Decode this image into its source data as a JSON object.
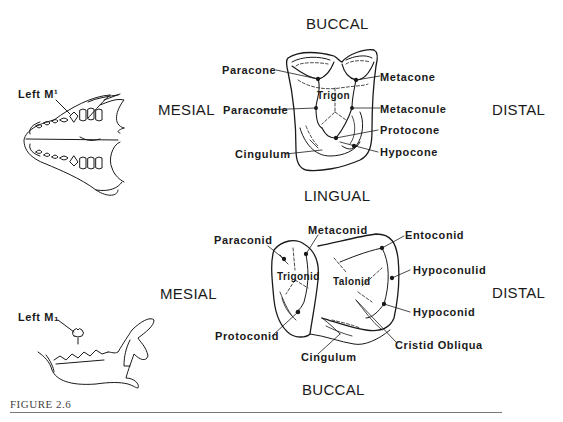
{
  "figure": {
    "caption": "FIGURE 2.6"
  },
  "upper": {
    "orientation": {
      "top": "BUCCAL",
      "bottom": "LINGUAL",
      "left": "MESIAL",
      "right": "DISTAL"
    },
    "skull_label": "Left M¹",
    "center_label": "Trigon",
    "left_labels": [
      "Paracone",
      "Paraconule",
      "Cingulum"
    ],
    "right_labels": [
      "Metacone",
      "Metaconule",
      "Protocone",
      "Hypocone"
    ]
  },
  "lower": {
    "orientation": {
      "top": "LINGUAL",
      "bottom": "BUCCAL",
      "left": "MESIAL",
      "right": "DISTAL"
    },
    "jaw_label": "Left M₁",
    "inner_labels": [
      "Trigonid",
      "Talonid"
    ],
    "left_labels": [
      "Paraconid",
      "Protoconid"
    ],
    "top_labels": [
      "Metaconid"
    ],
    "bottom_labels": [
      "Cingulum"
    ],
    "right_labels": [
      "Entoconid",
      "Hypoconulid",
      "Hypoconid",
      "Cristid Obliqua"
    ]
  }
}
